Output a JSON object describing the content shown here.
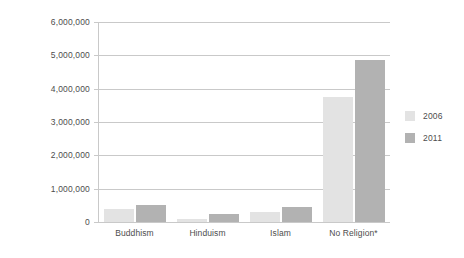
{
  "chart_data": {
    "type": "bar",
    "title": "",
    "xlabel": "",
    "ylabel": "Number of adherents",
    "categories": [
      "Buddhism",
      "Hinduism",
      "Islam",
      "No Religion*"
    ],
    "series": [
      {
        "name": "2006",
        "color": "#e3e3e3",
        "values": [
          400000,
          100000,
          300000,
          3750000
        ]
      },
      {
        "name": "2011",
        "color": "#b2b2b2",
        "values": [
          500000,
          230000,
          450000,
          4860000
        ]
      }
    ],
    "ylim": [
      0,
      6000000
    ],
    "ytick_values": [
      0,
      1000000,
      2000000,
      3000000,
      4000000,
      5000000,
      6000000
    ],
    "ytick_labels": [
      "0",
      "1,000,000",
      "2,000,000",
      "3,000,000",
      "4,000,000",
      "5,000,000",
      "6,000,000"
    ],
    "grid": true,
    "legend_position": "right"
  },
  "legend": {
    "entries": [
      {
        "label": "2006"
      },
      {
        "label": "2011"
      }
    ]
  }
}
